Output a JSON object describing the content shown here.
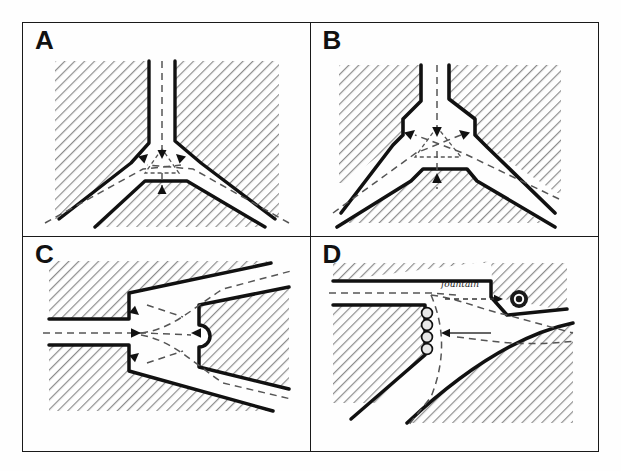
{
  "figure": {
    "background_color": "#fefefe",
    "ink_color": "#1a1a1a",
    "hatch_color": "#8d8d8d",
    "dash_color": "#4a4a4a",
    "layout": "2x2 grid of line-drawing diagrams",
    "panel_count": 4
  },
  "panels": [
    {
      "id": "A",
      "letter": "A",
      "name": "three-way-junction-narrow",
      "description": "Y-shaped three-way road junction with narrow carriageways meeting at a sharp point; hatched building blocks fill the three quadrants.",
      "arm_count": 3,
      "arms": [
        "north",
        "southwest",
        "southeast"
      ],
      "annotations": {
        "center_marker": "small dashed triangle",
        "arrow_count": 3,
        "arrow_style": "dashed with solid heads",
        "arrow_directions": [
          "north-inward",
          "southwest-inward",
          "southeast-inward"
        ]
      }
    },
    {
      "id": "B",
      "letter": "B",
      "name": "three-way-junction-chamfered",
      "description": "Same three-way junction widened with chamfered and stepped corners creating a larger open central space.",
      "arm_count": 3,
      "arms": [
        "north",
        "southwest",
        "southeast"
      ],
      "annotations": {
        "center_marker": "dashed triangle",
        "arrow_count": 3,
        "arrow_style": "dashed with solid heads",
        "corner_treatment": "chamfered / stepped setbacks"
      }
    },
    {
      "id": "C",
      "letter": "C",
      "name": "horizontal-fork-with-island-nose",
      "description": "Horizontal road entering from the left and forking into two diverging roads around a central hatched island whose tip carries a semicircular nose.",
      "arm_count": 3,
      "arms": [
        "west",
        "northeast",
        "southeast"
      ],
      "annotations": {
        "island_feature": "semicircular nose",
        "arrow_count": 4,
        "arrow_style": "dashed with solid heads"
      }
    },
    {
      "id": "D",
      "letter": "D",
      "name": "curved-junction-with-fountain",
      "description": "Curved three-way junction with a fountain set in the corner block and a row of bollards protecting the chamfered corner.",
      "arm_count": 3,
      "arms": [
        "west",
        "east",
        "southeast"
      ],
      "labels": [
        {
          "text": "fountain",
          "style": "handwritten-cursive",
          "points_to": "fountain-marker"
        }
      ],
      "features": {
        "fountain_marker": "filled circle with ring",
        "bollard_count": 4,
        "bollard_shape": "small circles in a vertical row",
        "corner_treatment": "chamfered corner"
      },
      "annotations": {
        "arrow_count": 2,
        "arrow_style": "dashed with solid heads"
      }
    }
  ]
}
